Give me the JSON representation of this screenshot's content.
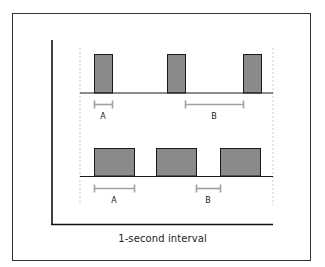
{
  "diagram": {
    "caption": "1-second interval",
    "colors": {
      "frame": "#333333",
      "axis": "#111111",
      "pulse_fill": "#8a8a8a",
      "pulse_stroke": "#1a1a1a",
      "bracket": "#a0a0a0",
      "guide": "#bdbdbd"
    },
    "rows": [
      {
        "name": "top-row",
        "description": "Narrow pulses, short on-time (A) and long off-time (B)",
        "pulses": [
          {
            "x": 94,
            "width": 18
          },
          {
            "x": 167,
            "width": 18
          },
          {
            "x": 243,
            "width": 18
          }
        ],
        "brackets": [
          {
            "label": "A",
            "x1": 94,
            "x2": 112
          },
          {
            "label": "B",
            "x1": 185,
            "x2": 243
          }
        ]
      },
      {
        "name": "bottom-row",
        "description": "Wide pulses, long on-time (A) and short off-time (B)",
        "pulses": [
          {
            "x": 94,
            "width": 40
          },
          {
            "x": 156,
            "width": 40
          },
          {
            "x": 220,
            "width": 40
          }
        ],
        "brackets": [
          {
            "label": "A",
            "x1": 94,
            "x2": 134
          },
          {
            "label": "B",
            "x1": 196,
            "x2": 220
          }
        ]
      }
    ]
  }
}
